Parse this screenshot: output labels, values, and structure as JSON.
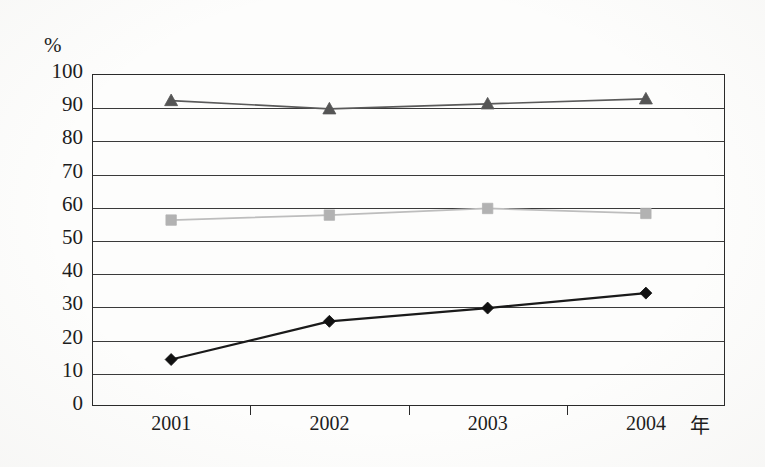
{
  "chart_data": {
    "type": "line",
    "title": "",
    "subtitle": "",
    "xlabel": "年",
    "ylabel": "%",
    "categories": [
      "2001",
      "2002",
      "2003",
      "2004"
    ],
    "x": [
      2001,
      2002,
      2003,
      2004
    ],
    "ylim": [
      0,
      100
    ],
    "ytick_step": 10,
    "yticks": [
      "100",
      "90",
      "80",
      "70",
      "60",
      "50",
      "40",
      "30",
      "20",
      "10",
      "0"
    ],
    "grid": true,
    "grid_axis": "y",
    "legend": false,
    "legend_position": "none",
    "series": [
      {
        "name": "series-triangle",
        "marker": "triangle",
        "color": "#555555",
        "line_color": "#5a5a5a",
        "values": [
          92,
          89.5,
          91,
          92.5
        ]
      },
      {
        "name": "series-square",
        "marker": "square",
        "color": "#b2b2b2",
        "line_color": "#bdbdbd",
        "values": [
          56,
          57.5,
          59.5,
          58
        ]
      },
      {
        "name": "series-diamond",
        "marker": "diamond",
        "color": "#111111",
        "line_color": "#1a1a1a",
        "values": [
          14,
          25.5,
          29.5,
          34
        ]
      }
    ]
  },
  "axes": {
    "unit_label": "%",
    "x_axis_name": "年"
  }
}
